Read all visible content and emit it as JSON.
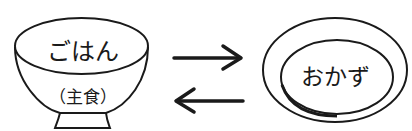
{
  "diagram": {
    "left_item": {
      "name": "rice-bowl",
      "label": "ごはん",
      "sublabel": "（主食）"
    },
    "right_item": {
      "name": "side-dish-plate",
      "label": "おかず"
    },
    "arrows": [
      {
        "direction": "right",
        "from": "ごはん",
        "to": "おかず"
      },
      {
        "direction": "left",
        "from": "おかず",
        "to": "ごはん"
      }
    ],
    "colors": {
      "stroke": "#1a1a1a",
      "background": "#ffffff"
    }
  }
}
